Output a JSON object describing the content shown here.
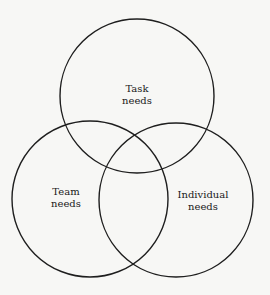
{
  "diagram": {
    "type": "venn",
    "stroke_color": "#1e1e1e",
    "background": "#f7f7f5",
    "circles": [
      {
        "id": "task",
        "line1": "Task",
        "line2": "needs",
        "cx": 137,
        "cy": 96,
        "r": 77
      },
      {
        "id": "team",
        "line1": "Team",
        "line2": "needs",
        "cx": 90,
        "cy": 199,
        "r": 78
      },
      {
        "id": "individual",
        "line1": "Individual",
        "line2": "needs",
        "cx": 176,
        "cy": 200,
        "r": 77
      }
    ]
  }
}
